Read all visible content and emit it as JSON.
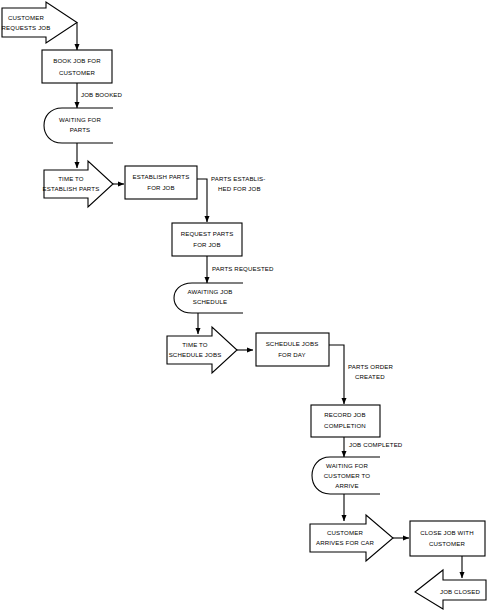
{
  "diagram": {
    "type": "flowchart",
    "colors": {
      "background": "#ffffff",
      "stroke": "#000000",
      "fill": "#ffffff",
      "text": "#000000"
    },
    "nodes": [
      {
        "id": "customer-requests-job",
        "shape": "arrow-right",
        "lines": [
          "CUSTOMER",
          "REQUESTS JOB"
        ],
        "line1": "CUSTOMER",
        "line2": "REQUESTS JOB"
      },
      {
        "id": "book-job-for-customer",
        "shape": "rectangle",
        "line1": "BOOK JOB FOR",
        "line2": "CUSTOMER"
      },
      {
        "id": "waiting-for-parts",
        "shape": "state",
        "line1": "WAITING FOR",
        "line2": "PARTS",
        "line3": ""
      },
      {
        "id": "time-to-establish-parts",
        "shape": "arrow-right",
        "line1": "TIME TO",
        "line2": "ESTABLISH PARTS"
      },
      {
        "id": "establish-parts-for-job",
        "shape": "rectangle",
        "line1": "ESTABLISH PARTS",
        "line2": "FOR JOB"
      },
      {
        "id": "request-parts-for-job",
        "shape": "rectangle",
        "line1": "REQUEST PARTS",
        "line2": "FOR JOB"
      },
      {
        "id": "awaiting-job-schedule",
        "shape": "state",
        "line1": "AWAITING JOB",
        "line2": "SCHEDULE",
        "line3": ""
      },
      {
        "id": "time-to-schedule-jobs",
        "shape": "arrow-right",
        "line1": "TIME TO",
        "line2": "SCHEDULE JOBS"
      },
      {
        "id": "schedule-jobs-for-day",
        "shape": "rectangle",
        "line1": "SCHEDULE JOBS",
        "line2": "FOR DAY"
      },
      {
        "id": "record-job-completion",
        "shape": "rectangle",
        "line1": "RECORD JOB",
        "line2": "COMPLETION"
      },
      {
        "id": "waiting-for-customer-to-arrive",
        "shape": "state",
        "line1": "WAITING FOR",
        "line2": "CUSTOMER TO",
        "line3": "ARRIVE"
      },
      {
        "id": "customer-arrives-for-car",
        "shape": "arrow-right",
        "line1": "CUSTOMER",
        "line2": "ARRIVES FOR CAR"
      },
      {
        "id": "close-job-with-customer",
        "shape": "rectangle",
        "line1": "CLOSE JOB WITH",
        "line2": "CUSTOMER"
      },
      {
        "id": "job-closed",
        "shape": "arrow-left",
        "line1": "JOB CLOSED",
        "line2": ""
      }
    ],
    "edges": [
      {
        "id": "edge-job-booked",
        "from": "book-job-for-customer",
        "to": "waiting-for-parts",
        "label": "JOB BOOKED"
      },
      {
        "id": "edge-parts-established",
        "from": "establish-parts-for-job",
        "to": "request-parts-for-job",
        "label_line1": "PARTS ESTABLIS-",
        "label_line2": "HED FOR JOB"
      },
      {
        "id": "edge-parts-requested",
        "from": "request-parts-for-job",
        "to": "awaiting-job-schedule",
        "label": "PARTS REQUESTED"
      },
      {
        "id": "edge-parts-order-created",
        "from": "schedule-jobs-for-day",
        "to": "record-job-completion",
        "label_line1": "PARTS ORDER",
        "label_line2": "CREATED"
      },
      {
        "id": "edge-job-completed",
        "from": "record-job-completion",
        "to": "waiting-for-customer-to-arrive",
        "label": "JOB COMPLETED"
      }
    ]
  }
}
